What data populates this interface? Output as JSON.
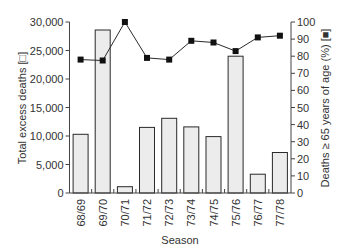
{
  "chart_data": {
    "type": "bar+line",
    "title": "",
    "xlabel": "Season",
    "categories": [
      "68/69",
      "69/70",
      "70/71",
      "71/72",
      "72/73",
      "73/74",
      "74/75",
      "75/76",
      "76/77",
      "77/78"
    ],
    "series": [
      {
        "name": "Total excess deaths",
        "type": "bar",
        "axis": "left",
        "marker": "open square",
        "values": [
          10300,
          28600,
          1100,
          11500,
          13100,
          11600,
          9900,
          24000,
          3300,
          7100
        ]
      },
      {
        "name": "Deaths ≥ 65 years of age (%)",
        "type": "line",
        "axis": "right",
        "marker": "filled square",
        "values": [
          78,
          77.5,
          100,
          79,
          78,
          89,
          88,
          83,
          91,
          92
        ]
      }
    ],
    "ylabel_left": "Total excess deaths [□]",
    "ylabel_right": "Deaths ≥ 65 years of age (%) [■]",
    "ylim_left": [
      0,
      30000
    ],
    "ylim_right": [
      0,
      100
    ],
    "yticks_left": [
      "0",
      "5,000",
      "10,000",
      "15,000",
      "20,000",
      "25,000",
      "30,000"
    ],
    "yticks_left_values": [
      0,
      5000,
      10000,
      15000,
      20000,
      25000,
      30000
    ],
    "yticks_right": [
      "0",
      "10",
      "20",
      "30",
      "40",
      "50",
      "60",
      "70",
      "80",
      "90",
      "100"
    ],
    "yticks_right_values": [
      0,
      10,
      20,
      30,
      40,
      50,
      60,
      70,
      80,
      90,
      100
    ],
    "grid": false,
    "legend": "none (symbols embedded in axis labels)"
  },
  "colors": {
    "bar_fill": "#ececec",
    "bar_stroke": "#2a2a2a",
    "line": "#2a2a2a",
    "marker": "#111111",
    "axis": "#444444",
    "text": "#333333"
  }
}
